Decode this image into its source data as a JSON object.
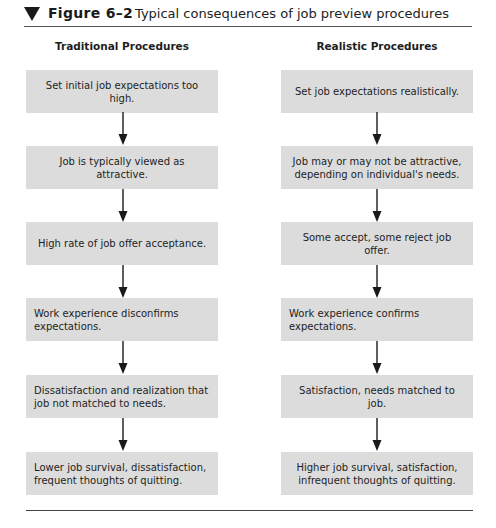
{
  "figure": {
    "number": "Figure 6–2",
    "title": "Typical consequences of job preview procedures",
    "marker_icon": "triangle-down-icon"
  },
  "columns": [
    {
      "header": "Traditional Procedures",
      "steps": [
        "Set initial job expectations too high.",
        "Job is typically viewed as attractive.",
        "High rate of job offer acceptance.",
        "Work experience disconfirms expectations.",
        "Dissatisfaction and realization that job not matched to needs.",
        "Lower job survival, dissatisfaction, frequent thoughts of quitting."
      ]
    },
    {
      "header": "Realistic Procedures",
      "steps": [
        "Set job expectations realistically.",
        "Job may or may not be attractive, depending on individual's needs.",
        "Some accept, some reject job offer.",
        "Work experience confirms expectations.",
        "Satisfaction, needs matched to job.",
        "Higher job survival, satisfaction, infrequent  thoughts of quitting."
      ]
    }
  ],
  "colors": {
    "box_fill": "#dcdcdc",
    "text": "#1e1e1e",
    "arrow": "#1a1a1a",
    "rule": "#444444"
  }
}
